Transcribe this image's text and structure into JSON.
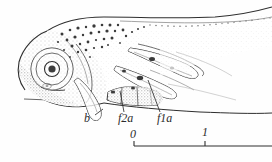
{
  "figure": {
    "kind": "scientific-line-drawing",
    "background_color": "#fefefe",
    "ink_color": "#4a4a4a",
    "labels": [
      {
        "id": "b",
        "text": "b",
        "x": 84,
        "y": 119,
        "meaning": "barbel"
      },
      {
        "id": "f2a",
        "text": "f2a",
        "x": 118,
        "y": 119,
        "meaning": "second anterior fin filament"
      },
      {
        "id": "f1a",
        "text": "f1a",
        "x": 157,
        "y": 119,
        "meaning": "first anterior fin filament"
      }
    ],
    "scale_bar": {
      "axis_y": 146,
      "x_start": 134,
      "x_end": 272,
      "ticks": [
        {
          "text": "0",
          "x": 134,
          "label_x": 130,
          "label_y": 132
        },
        {
          "text": "1",
          "x": 205,
          "label_x": 202,
          "label_y": 130
        }
      ]
    }
  }
}
